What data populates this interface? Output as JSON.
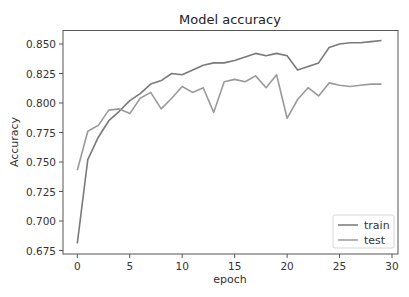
{
  "chart_data": {
    "type": "line",
    "title": "Model accuracy",
    "xlabel": "epoch",
    "ylabel": "Accuracy",
    "xlim": [
      -1.5,
      30.5
    ],
    "ylim": [
      0.6685,
      0.8615
    ],
    "xticks": [
      0,
      5,
      10,
      15,
      20,
      25,
      30
    ],
    "xtick_labels": [
      "0",
      "5",
      "10",
      "15",
      "20",
      "25",
      "30"
    ],
    "yticks": [
      0.675,
      0.7,
      0.725,
      0.75,
      0.775,
      0.8,
      0.825,
      0.85
    ],
    "ytick_labels": [
      "0.675",
      "0.700",
      "0.725",
      "0.750",
      "0.775",
      "0.800",
      "0.825",
      "0.850"
    ],
    "grid": false,
    "legend_position": "lower right",
    "x": [
      0,
      1,
      2,
      3,
      4,
      5,
      6,
      7,
      8,
      9,
      10,
      11,
      12,
      13,
      14,
      15,
      16,
      17,
      18,
      19,
      20,
      21,
      22,
      23,
      24,
      25,
      26,
      27,
      28,
      29
    ],
    "series": [
      {
        "name": "train",
        "color": "#7a7a7a",
        "values": [
          0.681,
          0.752,
          0.771,
          0.785,
          0.793,
          0.802,
          0.808,
          0.816,
          0.819,
          0.825,
          0.824,
          0.828,
          0.832,
          0.834,
          0.834,
          0.836,
          0.839,
          0.842,
          0.84,
          0.842,
          0.84,
          0.828,
          0.831,
          0.834,
          0.847,
          0.85,
          0.851,
          0.851,
          0.852,
          0.853
        ]
      },
      {
        "name": "test",
        "color": "#9a9a9a",
        "values": [
          0.743,
          0.776,
          0.781,
          0.794,
          0.795,
          0.791,
          0.804,
          0.809,
          0.795,
          0.804,
          0.814,
          0.809,
          0.813,
          0.792,
          0.818,
          0.82,
          0.818,
          0.823,
          0.813,
          0.824,
          0.787,
          0.803,
          0.813,
          0.806,
          0.817,
          0.815,
          0.814,
          0.815,
          0.816,
          0.816
        ]
      }
    ]
  }
}
